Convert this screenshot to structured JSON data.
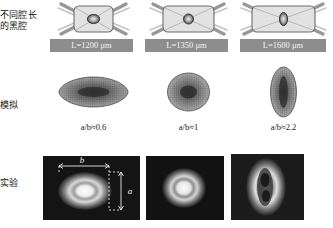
{
  "figure": {
    "type": "scientific-figure-grid",
    "columns": 3,
    "rows": 3,
    "badge_color": "#8d8d8d",
    "mesh_color": "#6e6e6e",
    "background": "#ffffff"
  },
  "row_labels": {
    "hohlraum": "不同腔长\n的黑腔",
    "hohlraum_line1": "不同腔长",
    "hohlraum_line2": "的黑腔",
    "simulation": "模拟",
    "experiment": "实验"
  },
  "columns": [
    {
      "id": "col-1",
      "cavity_length_label": "L=1200 μm",
      "cavity_length_value": 1200,
      "cavity_length_unit": "μm",
      "cavity_symbol": "L",
      "aspect_label": "a/b≈0.6",
      "aspect_value": 0.6,
      "capsule_shape": "oblate",
      "hohlraum_shape": "short-rounded-rect"
    },
    {
      "id": "col-2",
      "cavity_length_label": "L=1350 μm",
      "cavity_length_value": 1350,
      "cavity_length_unit": "μm",
      "cavity_symbol": "L",
      "aspect_label": "a/b≈1",
      "aspect_value": 1,
      "capsule_shape": "round",
      "hohlraum_shape": "medium-rounded-rect"
    },
    {
      "id": "col-3",
      "cavity_length_label": "L=1600 μm",
      "cavity_length_value": 1600,
      "cavity_length_unit": "μm",
      "cavity_symbol": "L",
      "aspect_label": "a/b≈2.2",
      "aspect_value": 2.2,
      "capsule_shape": "prolate",
      "hohlraum_shape": "long-rounded-rect"
    }
  ],
  "annotations": {
    "dimension_b": "b",
    "dimension_a": "a",
    "dimension_b_axis": "horizontal",
    "dimension_a_axis": "vertical"
  },
  "icons": {
    "hohlraum": "hohlraum-cavity-icon",
    "laser_beam": "laser-beam-icon",
    "capsule": "capsule-icon",
    "mesh": "simulation-mesh-icon",
    "xray_image": "xray-self-emission-image-icon"
  }
}
